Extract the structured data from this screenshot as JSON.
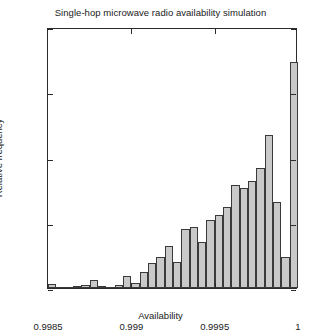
{
  "chart_data": {
    "type": "bar",
    "title": "Single-hop microwave radio availability simulation",
    "xlabel": "Availability",
    "ylabel": "Relative frequency",
    "xlim": [
      0.9985,
      1.0
    ],
    "ylim": [
      0,
      200
    ],
    "grid": false,
    "legend": null,
    "annotations": [
      {
        "text": "Mean availability = 99.9579%",
        "x": 0.99866,
        "y": 186
      }
    ],
    "xticks": [
      0.9985,
      0.999,
      0.9995,
      1
    ],
    "xtick_labels": [
      "0.9985",
      "0.999",
      "0.9995",
      "1"
    ],
    "yticks": [
      0,
      50,
      100,
      150,
      200
    ],
    "ytick_labels": [
      "0",
      "50",
      "100",
      "150",
      "200"
    ],
    "bin_width": 0.0005,
    "bin_edges": [
      0.9985,
      0.99855,
      0.9986,
      0.99865,
      0.9987,
      0.99875,
      0.9988,
      0.99885,
      0.9989,
      0.99895,
      0.999,
      0.99905,
      0.9991,
      0.99915,
      0.9992,
      0.99925,
      0.9993,
      0.99935,
      0.9994,
      0.99945,
      0.9995,
      0.99955,
      0.9996,
      0.99965,
      0.9997,
      0.99975,
      0.9998,
      0.99985,
      0.9999,
      0.99995,
      1.0
    ],
    "categories": [
      "0.99850",
      "0.99855",
      "0.99860",
      "0.99865",
      "0.99870",
      "0.99875",
      "0.99880",
      "0.99885",
      "0.99890",
      "0.99895",
      "0.99900",
      "0.99905",
      "0.99910",
      "0.99915",
      "0.99920",
      "0.99925",
      "0.99930",
      "0.99935",
      "0.99940",
      "0.99945",
      "0.99950",
      "0.99955",
      "0.99960",
      "0.99965",
      "0.99970",
      "0.99975",
      "0.99980",
      "0.99985",
      "0.99990",
      "0.99995"
    ],
    "values": [
      3,
      0,
      0,
      1,
      2,
      6,
      1,
      0,
      2,
      9,
      4,
      12,
      19,
      24,
      32,
      20,
      45,
      47,
      35,
      52,
      56,
      62,
      79,
      77,
      82,
      92,
      117,
      66,
      24,
      173
    ],
    "bar_fill_color": "#c9c9c9",
    "bar_edge_color": "#3a3a3a",
    "axis_color": "#2b2b2b",
    "background_color": "#ffffff"
  }
}
